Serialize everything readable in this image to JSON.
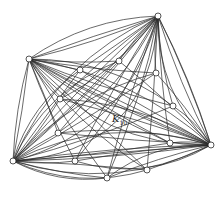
{
  "diagram": {
    "label_main": "K",
    "label_sub": "10",
    "stroke_color": "#2a2a2a",
    "vertex_fill": "#ffffff",
    "hubs": [
      [
        158,
        16
      ],
      [
        29,
        59
      ],
      [
        211,
        145
      ],
      [
        13,
        161
      ]
    ],
    "vertices": [
      [
        158,
        16
      ],
      [
        29,
        59
      ],
      [
        80,
        70
      ],
      [
        119,
        61
      ],
      [
        156,
        73
      ],
      [
        60,
        99
      ],
      [
        173,
        106
      ],
      [
        58,
        133
      ],
      [
        170,
        143
      ],
      [
        211,
        145
      ],
      [
        13,
        161
      ],
      [
        75,
        161
      ],
      [
        107,
        178
      ],
      [
        147,
        170
      ]
    ],
    "arcs": [
      [
        13,
        161,
        211,
        145,
        -40
      ],
      [
        13,
        161,
        211,
        145,
        40
      ],
      [
        29,
        59,
        211,
        145,
        -30
      ],
      [
        158,
        16,
        13,
        161,
        -60
      ],
      [
        158,
        16,
        13,
        161,
        40
      ],
      [
        29,
        59,
        158,
        16,
        -20
      ],
      [
        29,
        59,
        211,
        145,
        50
      ],
      [
        13,
        161,
        158,
        16,
        90
      ],
      [
        13,
        161,
        147,
        170,
        25
      ],
      [
        75,
        161,
        211,
        145,
        30
      ],
      [
        107,
        178,
        211,
        145,
        -20
      ],
      [
        13,
        161,
        107,
        178,
        15
      ],
      [
        29,
        59,
        173,
        106,
        -25
      ],
      [
        60,
        99,
        211,
        145,
        -20
      ],
      [
        58,
        133,
        211,
        145,
        -15
      ],
      [
        13,
        161,
        156,
        73,
        -25
      ],
      [
        13,
        161,
        119,
        61,
        -30
      ],
      [
        13,
        161,
        80,
        70,
        -20
      ],
      [
        29,
        59,
        170,
        143,
        10
      ],
      [
        29,
        59,
        147,
        170,
        15
      ],
      [
        158,
        16,
        58,
        133,
        -20
      ],
      [
        158,
        16,
        75,
        161,
        -15
      ],
      [
        158,
        16,
        107,
        178,
        -10
      ],
      [
        158,
        16,
        60,
        99,
        -15
      ],
      [
        158,
        16,
        211,
        145,
        30
      ],
      [
        158,
        16,
        211,
        145,
        -5
      ],
      [
        29,
        59,
        211,
        145,
        10
      ],
      [
        13,
        161,
        211,
        145,
        0
      ]
    ]
  }
}
